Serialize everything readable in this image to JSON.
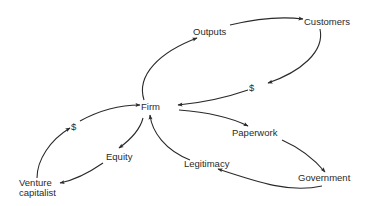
{
  "diagram": {
    "type": "flow-cycle",
    "nodes": {
      "firm": "Firm",
      "outputs": "Outputs",
      "customers": "Customers",
      "dollar_customers": "$",
      "paperwork": "Paperwork",
      "government": "Government",
      "legitimacy": "Legitimacy",
      "equity": "Equity",
      "venture_capitalist_line1": "Venture",
      "venture_capitalist_line2": "capitalist",
      "dollar_vc": "$"
    },
    "edges": [
      {
        "from": "Firm",
        "to": "Outputs"
      },
      {
        "from": "Outputs",
        "to": "Customers"
      },
      {
        "from": "Customers",
        "to": "$"
      },
      {
        "from": "$",
        "to": "Firm"
      },
      {
        "from": "Firm",
        "to": "Paperwork"
      },
      {
        "from": "Paperwork",
        "to": "Government"
      },
      {
        "from": "Government",
        "to": "Legitimacy"
      },
      {
        "from": "Legitimacy",
        "to": "Firm"
      },
      {
        "from": "Firm",
        "to": "Equity"
      },
      {
        "from": "Equity",
        "to": "Venture capitalist"
      },
      {
        "from": "Venture capitalist",
        "to": "$"
      },
      {
        "from": "$",
        "to": "Firm"
      }
    ],
    "colors": {
      "line": "#2a2a2a",
      "text": "#2a2a2a",
      "background": "#ffffff"
    }
  }
}
